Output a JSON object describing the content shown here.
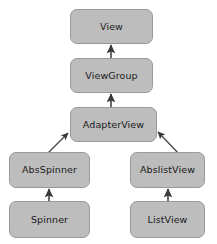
{
  "diagram": {
    "type": "class-hierarchy",
    "background_color": "#ffffff",
    "node_fill_color": "#bdbdbd",
    "node_border_color": "#9a9a9a",
    "node_text_color": "#1a1a1a",
    "edge_color": "#444444",
    "nodes": [
      {
        "id": "view",
        "label": "View",
        "x": 70,
        "y": 9,
        "w": 83,
        "h": 35
      },
      {
        "id": "viewgroup",
        "label": "ViewGroup",
        "x": 70,
        "y": 58,
        "w": 83,
        "h": 35
      },
      {
        "id": "adapterview",
        "label": "AdapterView",
        "x": 70,
        "y": 107,
        "w": 87,
        "h": 35
      },
      {
        "id": "absspinner",
        "label": "AbsSpinner",
        "x": 9,
        "y": 152,
        "w": 81,
        "h": 36
      },
      {
        "id": "abslistview",
        "label": "AbslistView",
        "x": 130,
        "y": 152,
        "w": 75,
        "h": 36
      },
      {
        "id": "spinner",
        "label": "Spinner",
        "x": 9,
        "y": 201,
        "w": 81,
        "h": 37
      },
      {
        "id": "listview",
        "label": "ListView",
        "x": 130,
        "y": 201,
        "w": 75,
        "h": 37
      }
    ],
    "edges": [
      {
        "id": "viewgroup-to-view",
        "from": "viewgroup",
        "to": "view",
        "x1": 111,
        "y1": 58,
        "x2": 111,
        "y2": 45,
        "kind": "vertical"
      },
      {
        "id": "adapterview-to-viewgroup",
        "from": "adapterview",
        "to": "viewgroup",
        "x1": 111,
        "y1": 107,
        "x2": 111,
        "y2": 94,
        "kind": "vertical"
      },
      {
        "id": "absspinner-to-adapterview",
        "from": "absspinner",
        "to": "adapterview",
        "x1": 45,
        "y1": 156,
        "x2": 68,
        "y2": 133,
        "kind": "diagonal"
      },
      {
        "id": "abslistview-to-adapterview",
        "from": "abslistview",
        "to": "adapterview",
        "x1": 181,
        "y1": 156,
        "x2": 158,
        "y2": 132,
        "kind": "diagonal"
      },
      {
        "id": "spinner-to-absspinner",
        "from": "spinner",
        "to": "absspinner",
        "x1": 49,
        "y1": 201,
        "x2": 49,
        "y2": 189,
        "kind": "vertical"
      },
      {
        "id": "listview-to-abslistview",
        "from": "listview",
        "to": "abslistview",
        "x1": 168,
        "y1": 201,
        "x2": 168,
        "y2": 189,
        "kind": "vertical"
      }
    ]
  }
}
